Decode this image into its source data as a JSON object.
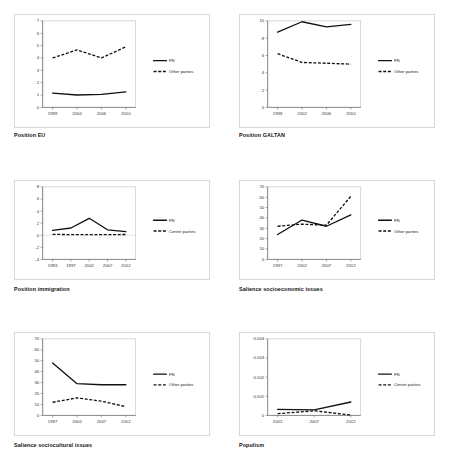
{
  "figure": {
    "panel_count": 6,
    "legend_labels": {
      "fn": "FN",
      "other": "Other parties",
      "centre": "Centre parties"
    }
  },
  "chart_data": [
    {
      "id": "position-eu",
      "type": "line",
      "title": "Position EU",
      "xlabel": "",
      "ylabel": "",
      "x": [
        "1999",
        "2002",
        "2006",
        "2010"
      ],
      "ylim": [
        0,
        7
      ],
      "yticks": [
        "0",
        "1",
        "2",
        "3",
        "4",
        "5",
        "6",
        "7"
      ],
      "grid": false,
      "legend_position": "right",
      "series": [
        {
          "name": "FN",
          "style": "solid",
          "values": [
            1.15,
            1.0,
            1.05,
            1.25
          ]
        },
        {
          "name": "Other parties",
          "style": "dashed",
          "values": [
            4.0,
            4.65,
            4.0,
            4.9
          ]
        }
      ]
    },
    {
      "id": "position-galtan",
      "type": "line",
      "title": "Position GALTAN",
      "xlabel": "",
      "ylabel": "",
      "x": [
        "1998",
        "2002",
        "2006",
        "2010"
      ],
      "ylim": [
        0,
        10
      ],
      "yticks": [
        "0",
        "2",
        "4",
        "6",
        "8",
        "10"
      ],
      "grid": false,
      "legend_position": "right",
      "series": [
        {
          "name": "FN",
          "style": "solid",
          "values": [
            8.7,
            9.9,
            9.3,
            9.6
          ]
        },
        {
          "name": "Other parties",
          "style": "dashed",
          "values": [
            6.2,
            5.2,
            5.1,
            5.0
          ]
        }
      ]
    },
    {
      "id": "position-immigration",
      "type": "line",
      "title": "Position immigration",
      "xlabel": "",
      "ylabel": "",
      "x": [
        "1993",
        "1997",
        "2002",
        "2007",
        "2012"
      ],
      "ylim": [
        -4,
        8
      ],
      "yticks": [
        "-4",
        "-2",
        "0",
        "2",
        "4",
        "6",
        "8"
      ],
      "grid": false,
      "legend_position": "right",
      "series": [
        {
          "name": "FN",
          "style": "solid",
          "values": [
            0.8,
            1.2,
            2.8,
            0.9,
            0.6
          ]
        },
        {
          "name": "Centre parties",
          "style": "dashed",
          "values": [
            0.15,
            0.1,
            0.1,
            0.1,
            0.12
          ]
        }
      ]
    },
    {
      "id": "salience-socioeconomic",
      "type": "line",
      "title": "Salience socioeconomic issues",
      "xlabel": "",
      "ylabel": "",
      "x": [
        "1997",
        "2002",
        "2007",
        "2012"
      ],
      "ylim": [
        0,
        70
      ],
      "yticks": [
        "0",
        "10",
        "20",
        "30",
        "40",
        "50",
        "60",
        "70"
      ],
      "grid": false,
      "legend_position": "right",
      "series": [
        {
          "name": "FN",
          "style": "solid",
          "values": [
            24,
            38,
            32,
            43
          ]
        },
        {
          "name": "Other parties",
          "style": "dashed",
          "values": [
            32,
            34,
            33,
            61
          ]
        }
      ]
    },
    {
      "id": "salience-sociocultural",
      "type": "line",
      "title": "Salience sociocultural issues",
      "xlabel": "",
      "ylabel": "",
      "x": [
        "1997",
        "2002",
        "2007",
        "2012"
      ],
      "ylim": [
        0,
        70
      ],
      "yticks": [
        "0",
        "10",
        "20",
        "30",
        "40",
        "50",
        "60",
        "70"
      ],
      "grid": false,
      "legend_position": "right",
      "series": [
        {
          "name": "FN",
          "style": "solid",
          "values": [
            48,
            29,
            28,
            28
          ]
        },
        {
          "name": "Other parties",
          "style": "dashed",
          "values": [
            12,
            16,
            13,
            8
          ]
        }
      ]
    },
    {
      "id": "populism",
      "type": "line",
      "title": "Populism",
      "xlabel": "",
      "ylabel": "",
      "x": [
        "2002",
        "2007",
        "2012"
      ],
      "ylim": [
        0,
        0.004
      ],
      "yticks": [
        "0",
        "0.001",
        "0.002",
        "0.003",
        "0.004"
      ],
      "grid": false,
      "legend_position": "right",
      "series": [
        {
          "name": "FN",
          "style": "solid",
          "values": [
            0.00031,
            0.00029,
            0.0007
          ]
        },
        {
          "name": "Centre parties",
          "style": "dashed",
          "values": [
            9e-05,
            0.00024,
            2e-05
          ]
        }
      ]
    }
  ]
}
